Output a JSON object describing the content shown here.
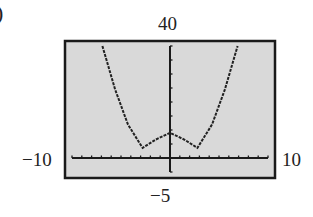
{
  "figure_label": ")",
  "window": {
    "xmin_label": "−10",
    "xmax_label": "10",
    "ymax_label": "40",
    "ymin_label": "−5"
  },
  "colors": {
    "screen": "#d9d9d9",
    "frame": "#1a1a1a",
    "curve": "#222222"
  },
  "chart_data": {
    "type": "line",
    "title": "",
    "xlabel": "",
    "ylabel": "",
    "xlim": [
      -10,
      10
    ],
    "ylim": [
      -5,
      40
    ],
    "x_tick_step": 1,
    "y_tick_step": 5,
    "grid": false,
    "legend": null,
    "series": [
      {
        "name": "graph",
        "x": [
          -6.9,
          -5.6,
          -4.3,
          -2.8,
          -1.5,
          0,
          1.5,
          2.8,
          4.3,
          5.6,
          6.9
        ],
        "y": [
          40,
          24.5,
          12,
          3.6,
          6.5,
          9,
          6.5,
          3.6,
          12,
          24.5,
          40
        ]
      }
    ],
    "annotations": [
      "−10",
      "10",
      "40",
      "−5"
    ]
  }
}
